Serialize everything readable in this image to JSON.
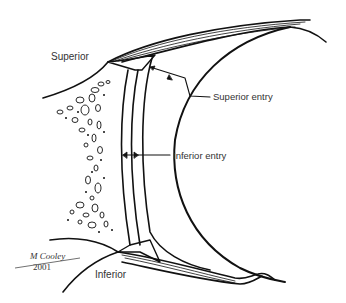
{
  "labels": {
    "superior": "Superior",
    "superior_entry": "Superior entry",
    "inferior_entry": "Inferior entry",
    "inferior": "Inferior"
  },
  "signature": {
    "name": "M Cooley",
    "year": "2001"
  },
  "colors": {
    "ink": "#111111",
    "text": "#333333",
    "background": "#ffffff"
  }
}
